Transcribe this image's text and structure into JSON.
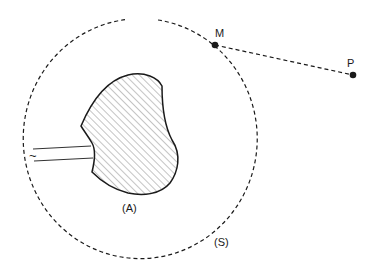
{
  "diagram": {
    "labels": {
      "point_m": "M",
      "point_p": "P",
      "body": "(A)",
      "surface": "(S)",
      "source_symbol": "~"
    },
    "elements": {
      "surface": {
        "type": "dashed-closed-curve",
        "label": "(S)",
        "gap": "top"
      },
      "body": {
        "type": "hatched-region",
        "label": "(A)"
      },
      "feed_line": {
        "type": "two parallel wires",
        "symbol": "~",
        "description": "AC source leads connected to body (A)"
      },
      "segment_mp": {
        "type": "dashed-line",
        "from": "M",
        "to": "P"
      },
      "points": [
        "M",
        "P"
      ]
    },
    "colors": {
      "stroke": "#1a1a1a",
      "hatch": "#555555",
      "background": "#ffffff"
    }
  }
}
